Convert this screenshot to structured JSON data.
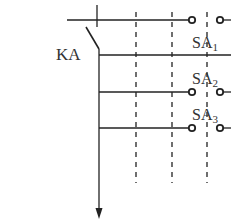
{
  "diagram": {
    "type": "relay contact circuit",
    "relay_label": "KA",
    "switches": [
      {
        "label": "SA",
        "subscript": "1"
      },
      {
        "label": "SA",
        "subscript": "2"
      },
      {
        "label": "SA",
        "subscript": "3"
      }
    ],
    "colors": {
      "line": "#222222",
      "text": "#333333",
      "background": "#ffffff"
    }
  }
}
